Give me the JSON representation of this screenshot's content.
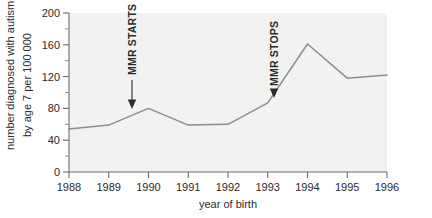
{
  "chart_data": {
    "type": "line",
    "title": "",
    "subtitle": "",
    "xlabel": "year of birth",
    "ylabel": "number diagnosed with autism by age 7 per 100 000",
    "ylabel_line1": "number diagnosed with autism",
    "ylabel_line2": "by age 7 per 100 000",
    "x": [
      1988,
      1989,
      1990,
      1991,
      1992,
      1993,
      1994,
      1995,
      1996
    ],
    "values": [
      54,
      59,
      80,
      59,
      60,
      87,
      161,
      118,
      122
    ],
    "categories": [
      "1988",
      "1989",
      "1990",
      "1991",
      "1992",
      "1993",
      "1994",
      "1995",
      "1996"
    ],
    "xtick_labels": [
      "1988",
      "1989",
      "1990",
      "1991",
      "1992",
      "1993",
      "1994",
      "1995",
      "1996"
    ],
    "ytick_labels": [
      "0",
      "40",
      "80",
      "120",
      "160",
      "200"
    ],
    "ytick_values": [
      0,
      40,
      80,
      120,
      160,
      200
    ],
    "yminor_values": [
      20,
      60,
      100,
      140,
      180
    ],
    "xlim": [
      1988,
      1996
    ],
    "ylim": [
      0,
      200
    ],
    "grid": false,
    "legend": false,
    "legend_position": "none",
    "line_color": "#8c8c8c",
    "plot_background": "#f2f2f0",
    "axis_color": "#6d6d6d",
    "annotations": [
      {
        "label": "MMR STARTS",
        "x": 1989.6,
        "points_to_value": 80,
        "orientation": "vertical",
        "arrow": "down"
      },
      {
        "label": "MMR STOPS",
        "x": 1993.1,
        "points_to_value": 87,
        "orientation": "vertical",
        "arrow": "down"
      }
    ]
  }
}
